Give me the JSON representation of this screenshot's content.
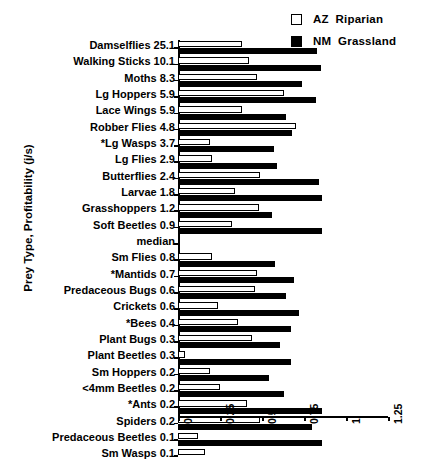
{
  "chart_data": {
    "type": "bar",
    "orientation": "horizontal",
    "title": "",
    "xlabel": "",
    "ylabel": "Prey Type, Profitability (j/s)",
    "xlim": [
      0,
      1.25
    ],
    "xticks": [
      "0",
      "0.25",
      "0.5",
      "0.75",
      "1",
      "1.25"
    ],
    "xtick_values": [
      0,
      0.25,
      0.5,
      0.75,
      1,
      1.25
    ],
    "grid": false,
    "legend_position": "top-right",
    "legend": [
      {
        "key": "az",
        "label": "AZ  Riparian",
        "swatch": "open",
        "color": "#ffffff"
      },
      {
        "key": "nm",
        "label": "NM  Grassland",
        "swatch": "filled",
        "color": "#000000"
      }
    ],
    "categories": [
      "Damselflies",
      "Walking Sticks",
      "Moths",
      "Lg Hoppers",
      "Lace Wings",
      "Robber Flies",
      "*Lg Wasps",
      "Lg Flies",
      "Butterflies",
      "Larvae",
      "Grasshoppers",
      "Soft Beetles",
      "median",
      "Sm Flies",
      "*Mantids",
      "Predaceous Bugs",
      "Crickets",
      "*Bees",
      "Plant Bugs",
      "Plant Beetles",
      "Sm Hoppers",
      "<4mm Beetles",
      "*Ants",
      "Spiders",
      "Predaceous Beetles",
      "Sm Wasps"
    ],
    "profitability": [
      "25.1",
      "10.1",
      "8.3",
      "5.9",
      "5.9",
      "4.8",
      "3.7",
      "2.9",
      "2.4",
      "1.8",
      "1.2",
      "0.9",
      "",
      "0.8",
      "0.7",
      "0.6",
      "0.6",
      "0.4",
      "0.3",
      "0.3",
      "0.2",
      "0.2",
      "0.2",
      "0.2",
      "0.1",
      "0.1"
    ],
    "series": [
      {
        "name": "AZ  Riparian",
        "values": [
          0.38,
          0.42,
          0.47,
          0.63,
          0.38,
          0.7,
          0.19,
          0.2,
          0.49,
          0.34,
          0.48,
          0.32,
          null,
          0.2,
          0.47,
          0.46,
          0.24,
          0.36,
          0.44,
          0.04,
          0.19,
          0.25,
          0.41,
          0.49,
          0.12,
          0.16
        ]
      },
      {
        "name": "NM  Grassland",
        "values": [
          0.83,
          0.85,
          0.74,
          0.82,
          0.64,
          0.68,
          0.57,
          0.59,
          0.84,
          0.86,
          0.56,
          0.86,
          null,
          0.58,
          0.69,
          0.64,
          0.72,
          0.67,
          0.61,
          0.67,
          0.54,
          0.63,
          0.86,
          0.8,
          0.86,
          null
        ]
      }
    ]
  }
}
